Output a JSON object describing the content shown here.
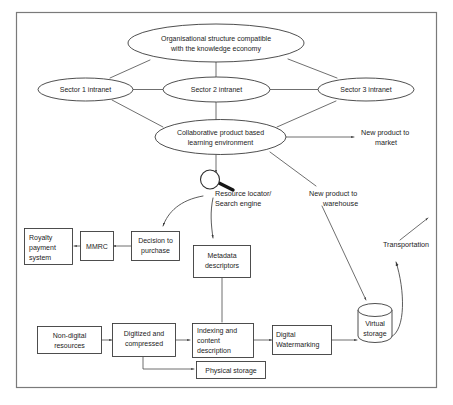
{
  "diagram": {
    "frame": {
      "stroke": "#7a7a7a"
    },
    "colors": {
      "node_stroke": "#3b3b3b",
      "edge_stroke": "#4a4a4a",
      "frame_stroke": "#7a7a7a",
      "text": "#1c1c1c",
      "background": "#ffffff"
    },
    "ellipses": {
      "org_structure": {
        "line1": "Organisational structure compatible",
        "line2": "with the knowledge economy"
      },
      "sector1": {
        "label": "Sector 1 intranet"
      },
      "sector2": {
        "label": "Sector 2 intranet"
      },
      "sector3": {
        "label": "Sector 3 intranet"
      },
      "collaborative": {
        "line1": "Collaborative product based",
        "line2": "learning environment"
      }
    },
    "boxes": {
      "royalty": {
        "line1": "Royalty",
        "line2": "payment",
        "line3": "system"
      },
      "mmrc": {
        "label": "MMRC"
      },
      "decision": {
        "line1": "Decision to",
        "line2": "purchase"
      },
      "metadata": {
        "line1": "Metadata",
        "line2": "descriptors"
      },
      "nondigital": {
        "line1": "Non-digital",
        "line2": "resources"
      },
      "digitized": {
        "line1": "Digitized and",
        "line2": "compressed"
      },
      "indexing": {
        "line1": "Indexing and",
        "line2": "content",
        "line3": "description"
      },
      "watermarking": {
        "line1": "Digital",
        "line2": "Watermarking"
      },
      "physical_storage": {
        "label": "Physical storage"
      }
    },
    "cylinder": {
      "virtual_storage": {
        "line1": "Virtual",
        "line2": "storage"
      }
    },
    "free_labels": {
      "new_product_market": {
        "line1": "New product to",
        "line2": "market"
      },
      "new_product_warehouse": {
        "line1": "New product to",
        "line2": "warehouse"
      },
      "resource_locator": {
        "line1": "Resource locator/",
        "line2": "Search engine"
      },
      "transportation": {
        "label": "Transportation"
      }
    },
    "icons": {
      "magnifier": {
        "name": "magnifying-glass-icon"
      }
    }
  }
}
